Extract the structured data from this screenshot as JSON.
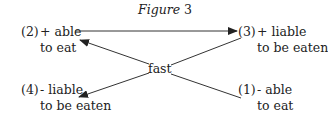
{
  "figure": {
    "title_word": "Figure",
    "title_number": "3"
  },
  "nodes": [
    {
      "id": "n2",
      "index": "(2)",
      "line1": "+ able",
      "line2": "to eat"
    },
    {
      "id": "n3",
      "index": "(3)",
      "line1": "+ liable",
      "line2": "to be eaten"
    },
    {
      "id": "n4",
      "index": "(4)",
      "line1": "- liable",
      "line2": "to be eaten"
    },
    {
      "id": "n1",
      "index": "(1)",
      "line1": "- able",
      "line2": "to eat"
    }
  ],
  "center_label": "fast",
  "edges": [
    {
      "from": "(2)",
      "to": "(3)",
      "type": "arrow"
    },
    {
      "from": "(3)",
      "to": "(4)",
      "via": "fast",
      "type": "arrow"
    },
    {
      "from": "(1)",
      "to": "(2)",
      "via": "fast",
      "type": "arrow"
    }
  ]
}
